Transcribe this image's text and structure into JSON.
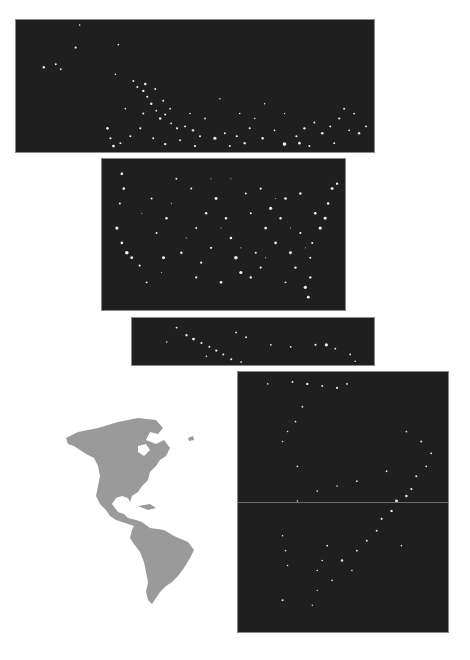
{
  "scene": {
    "description": "Composite of nighttime satellite imagery panels of the Americas alongside a grey silhouette map",
    "background": "#ffffff",
    "panel_color": "#1f1f1f",
    "light_color": "#f4f4f4",
    "landmass_color": "#9a9a9a"
  },
  "panels": [
    {
      "id": "canada-alaska",
      "label": "Northern North America at night",
      "x": 15,
      "y": 19,
      "w": 360,
      "h": 134
    },
    {
      "id": "usa",
      "label": "Contiguous United States at night",
      "x": 101,
      "y": 158,
      "w": 245,
      "h": 153
    },
    {
      "id": "mexico-central",
      "label": "Mexico and Central America at night",
      "x": 131,
      "y": 317,
      "w": 244,
      "h": 49
    },
    {
      "id": "south-america",
      "label": "South America at night",
      "x": 237,
      "y": 371,
      "w": 212,
      "h": 262,
      "seam_y": 130
    }
  ],
  "locator_map": {
    "label": "Americas silhouette map",
    "x": 38,
    "y": 400,
    "w": 160,
    "h": 210
  }
}
